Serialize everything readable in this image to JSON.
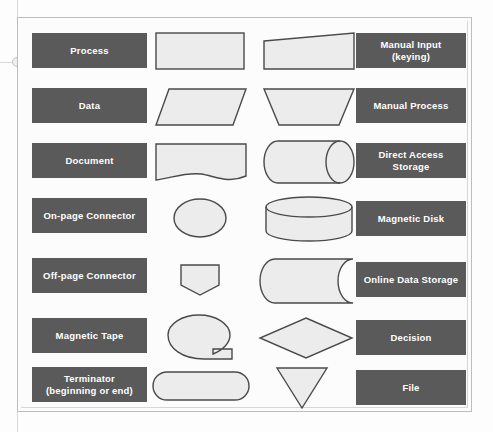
{
  "diagram": {
    "colors": {
      "label_bar": "#5a5a5a",
      "label_text": "#ffffff",
      "shape_fill": "#ececec",
      "shape_stroke": "#4a4a4a",
      "page_background": "#fcfcfc",
      "frame_border": "#bdbdbd"
    },
    "left_column": [
      {
        "label": "Process",
        "shape": "rectangle"
      },
      {
        "label": "Data",
        "shape": "parallelogram"
      },
      {
        "label": "Document",
        "shape": "document-wave"
      },
      {
        "label": "On-page Connector",
        "shape": "ellipse"
      },
      {
        "label": "Off-page Connector",
        "shape": "pentagon-down"
      },
      {
        "label": "Magnetic Tape",
        "shape": "circle-with-tab"
      },
      {
        "label": "Terminator\n(beginning or end)",
        "shape": "stadium"
      }
    ],
    "right_column": [
      {
        "label": "Manual Input\n(keying)",
        "shape": "slanted-top-rectangle"
      },
      {
        "label": "Manual Process",
        "shape": "inverted-trapezoid"
      },
      {
        "label": "Direct Access\nStorage",
        "shape": "horizontal-cylinder"
      },
      {
        "label": "Magnetic Disk",
        "shape": "vertical-cylinder"
      },
      {
        "label": "Online Data Storage",
        "shape": "stored-data"
      },
      {
        "label": "Decision",
        "shape": "diamond"
      },
      {
        "label": "File",
        "shape": "triangle-down"
      }
    ]
  }
}
